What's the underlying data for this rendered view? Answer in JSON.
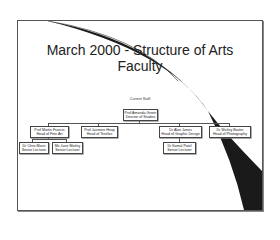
{
  "slide": {
    "title_line1": "March 2000 - Structure of Arts",
    "title_line2": "Faculty",
    "caption": "Current Staff"
  },
  "org_chart": {
    "root": {
      "name": "Prof Amanda Green",
      "role": "Director of Studies"
    },
    "heads": [
      {
        "name": "Prof Martin Francis",
        "role": "Head of Fine Art"
      },
      {
        "name": "Prof Jasmine Heap",
        "role": "Head of Textiles"
      },
      {
        "name": "Dr Alan Jones",
        "role": "Head of Graphic Design"
      },
      {
        "name": "Dr Shirley Baxter",
        "role": "Head of Photography"
      }
    ],
    "fine_art_staff": [
      {
        "name": "Dr Chris Mann",
        "role": "Senior Lecturer"
      },
      {
        "name": "Ms Jane Morley",
        "role": "Senior Lecturer"
      }
    ],
    "graphic_design_staff": [
      {
        "name": "Dr Kamal Patel",
        "role": "Senior Lecturer"
      }
    ]
  },
  "colors": {
    "frame": "#555555",
    "swoosh": "#1a1a1a",
    "text": "#222222"
  }
}
